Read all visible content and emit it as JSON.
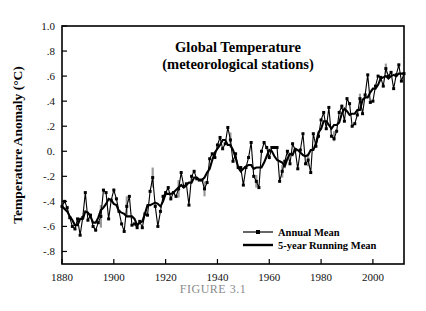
{
  "figure": {
    "caption": "FIGURE 3.1",
    "caption_color": "#8a8a8a",
    "background": "#ffffff",
    "frame_color": "#000000"
  },
  "chart_data": {
    "type": "line",
    "title": "Global Temperature",
    "subtitle": "(meteorological stations)",
    "xlabel": "",
    "ylabel": "Temperature Anomaly (°C)",
    "xlim": [
      1880,
      2012
    ],
    "ylim": [
      -0.9,
      1.0
    ],
    "xticks": [
      1880,
      1900,
      1920,
      1940,
      1960,
      1980,
      2000
    ],
    "xticklabels": [
      "1880",
      "1900",
      "1920",
      "1940",
      "1960",
      "1980",
      "2000"
    ],
    "yticks": [
      -0.8,
      -0.6,
      -0.4,
      -0.2,
      0.0,
      0.2,
      0.4,
      0.6,
      0.8,
      1.0
    ],
    "yticklabels": [
      "-.8",
      "-.6",
      "-.4",
      "-.2",
      "0.",
      ".2",
      ".4",
      ".6",
      ".8",
      "1.0"
    ],
    "grid": false,
    "legend_position": "bottom-right",
    "legend": [
      {
        "name": "Annual Mean",
        "marker": "square",
        "linewidth": "thin",
        "color": "#000000"
      },
      {
        "name": "5-year Running Mean",
        "marker": "none",
        "linewidth": "thick",
        "color": "#000000"
      }
    ],
    "x": [
      1880,
      1881,
      1882,
      1883,
      1884,
      1885,
      1886,
      1887,
      1888,
      1889,
      1890,
      1891,
      1892,
      1893,
      1894,
      1895,
      1896,
      1897,
      1898,
      1899,
      1900,
      1901,
      1902,
      1903,
      1904,
      1905,
      1906,
      1907,
      1908,
      1909,
      1910,
      1911,
      1912,
      1913,
      1914,
      1915,
      1916,
      1917,
      1918,
      1919,
      1920,
      1921,
      1922,
      1923,
      1924,
      1925,
      1926,
      1927,
      1928,
      1929,
      1930,
      1931,
      1932,
      1933,
      1934,
      1935,
      1936,
      1937,
      1938,
      1939,
      1940,
      1941,
      1942,
      1943,
      1944,
      1945,
      1946,
      1947,
      1948,
      1949,
      1950,
      1951,
      1952,
      1953,
      1954,
      1955,
      1956,
      1957,
      1958,
      1959,
      1960,
      1961,
      1962,
      1963,
      1964,
      1965,
      1966,
      1967,
      1968,
      1969,
      1970,
      1971,
      1972,
      1973,
      1974,
      1975,
      1976,
      1977,
      1978,
      1979,
      1980,
      1981,
      1982,
      1983,
      1984,
      1985,
      1986,
      1987,
      1988,
      1989,
      1990,
      1991,
      1992,
      1993,
      1994,
      1995,
      1996,
      1997,
      1998,
      1999,
      2000,
      2001,
      2002,
      2003,
      2004,
      2005,
      2006,
      2007,
      2008,
      2009,
      2010,
      2011,
      2012
    ],
    "series": [
      {
        "name": "Annual Mean",
        "values": [
          -0.44,
          -0.4,
          -0.45,
          -0.53,
          -0.6,
          -0.62,
          -0.54,
          -0.67,
          -0.53,
          -0.33,
          -0.55,
          -0.51,
          -0.6,
          -0.63,
          -0.57,
          -0.52,
          -0.31,
          -0.33,
          -0.54,
          -0.39,
          -0.31,
          -0.38,
          -0.48,
          -0.58,
          -0.64,
          -0.44,
          -0.36,
          -0.59,
          -0.58,
          -0.61,
          -0.56,
          -0.61,
          -0.5,
          -0.51,
          -0.32,
          -0.21,
          -0.44,
          -0.6,
          -0.48,
          -0.36,
          -0.33,
          -0.29,
          -0.38,
          -0.33,
          -0.36,
          -0.3,
          -0.17,
          -0.28,
          -0.26,
          -0.43,
          -0.2,
          -0.16,
          -0.22,
          -0.23,
          -0.23,
          -0.3,
          -0.25,
          -0.06,
          -0.02,
          -0.05,
          0.05,
          0.11,
          0.02,
          0.06,
          0.19,
          0.09,
          -0.08,
          -0.02,
          -0.13,
          -0.13,
          -0.27,
          -0.13,
          -0.05,
          0.07,
          -0.2,
          -0.24,
          -0.29,
          0.0,
          0.07,
          0.03,
          -0.05,
          0.03,
          0.03,
          0.03,
          -0.24,
          -0.16,
          -0.08,
          0.0,
          -0.1,
          0.06,
          0.01,
          -0.14,
          0.01,
          0.14,
          -0.1,
          -0.07,
          -0.17,
          0.14,
          0.04,
          0.12,
          0.25,
          0.31,
          0.18,
          0.35,
          0.12,
          0.1,
          0.16,
          0.31,
          0.36,
          0.24,
          0.42,
          0.38,
          0.2,
          0.22,
          0.29,
          0.42,
          0.3,
          0.45,
          0.61,
          0.39,
          0.4,
          0.52,
          0.6,
          0.59,
          0.52,
          0.66,
          0.6,
          0.63,
          0.5,
          0.61,
          0.69,
          0.56,
          0.62
        ]
      },
      {
        "name": "5-year Running Mean",
        "values": [
          -0.44,
          -0.46,
          -0.48,
          -0.52,
          -0.55,
          -0.59,
          -0.59,
          -0.54,
          -0.54,
          -0.48,
          -0.49,
          -0.52,
          -0.57,
          -0.57,
          -0.53,
          -0.47,
          -0.45,
          -0.42,
          -0.38,
          -0.39,
          -0.42,
          -0.43,
          -0.48,
          -0.49,
          -0.5,
          -0.52,
          -0.52,
          -0.52,
          -0.54,
          -0.59,
          -0.57,
          -0.56,
          -0.5,
          -0.43,
          -0.43,
          -0.42,
          -0.41,
          -0.42,
          -0.44,
          -0.4,
          -0.34,
          -0.34,
          -0.34,
          -0.33,
          -0.31,
          -0.29,
          -0.27,
          -0.29,
          -0.27,
          -0.25,
          -0.25,
          -0.21,
          -0.21,
          -0.23,
          -0.23,
          -0.21,
          -0.17,
          -0.14,
          -0.07,
          -0.01,
          0.02,
          0.05,
          0.09,
          0.09,
          0.05,
          0.05,
          0.01,
          -0.05,
          -0.13,
          -0.16,
          -0.14,
          -0.12,
          -0.11,
          -0.11,
          -0.14,
          -0.13,
          -0.13,
          -0.13,
          -0.09,
          -0.04,
          0.01,
          0.0,
          -0.04,
          -0.07,
          -0.08,
          -0.09,
          -0.12,
          -0.06,
          -0.02,
          -0.03,
          0.02,
          0.01,
          -0.01,
          -0.03,
          -0.04,
          -0.03,
          0.01,
          0.01,
          0.06,
          0.15,
          0.18,
          0.24,
          0.24,
          0.21,
          0.18,
          0.21,
          0.21,
          0.23,
          0.3,
          0.34,
          0.32,
          0.29,
          0.3,
          0.3,
          0.33,
          0.33,
          0.41,
          0.43,
          0.43,
          0.47,
          0.5,
          0.5,
          0.53,
          0.58,
          0.59,
          0.6,
          0.58,
          0.6,
          0.61,
          0.6,
          0.62,
          0.62,
          0.62
        ]
      }
    ],
    "error_bars": {
      "color": "#9a9a9a",
      "points": [
        {
          "x": 1895,
          "y": -0.52,
          "err": 0.09
        },
        {
          "x": 1905,
          "y": -0.44,
          "err": 0.08
        },
        {
          "x": 1915,
          "y": -0.21,
          "err": 0.08
        },
        {
          "x": 1925,
          "y": -0.3,
          "err": 0.07
        },
        {
          "x": 1935,
          "y": -0.3,
          "err": 0.06
        },
        {
          "x": 1945,
          "y": 0.09,
          "err": 0.06
        },
        {
          "x": 1955,
          "y": -0.24,
          "err": 0.05
        },
        {
          "x": 1965,
          "y": -0.16,
          "err": 0.05
        },
        {
          "x": 1975,
          "y": -0.07,
          "err": 0.05
        },
        {
          "x": 1985,
          "y": 0.12,
          "err": 0.04
        },
        {
          "x": 1995,
          "y": 0.42,
          "err": 0.04
        },
        {
          "x": 2005,
          "y": 0.66,
          "err": 0.04
        }
      ]
    }
  }
}
